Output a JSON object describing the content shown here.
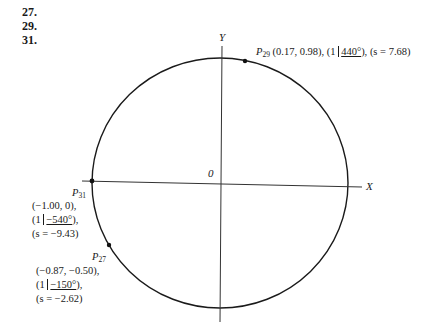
{
  "problem_numbers": [
    "27.",
    "29.",
    "31."
  ],
  "axes": {
    "x_label": "X",
    "y_label": "Y",
    "origin_label": "0"
  },
  "points": {
    "p29": {
      "name": "P",
      "sub": "29",
      "coords": "(0.17, 0.98),",
      "polar_prefix": "(1 ",
      "angle": "440°",
      "polar_suffix": "),",
      "arc": "(s = 7.68)"
    },
    "p31": {
      "name": "P",
      "sub": "31",
      "coords": "(−1.00, 0),",
      "polar_prefix": "(1 ",
      "angle": "−540°",
      "polar_suffix": "),",
      "arc": "(s = −9.43)"
    },
    "p27": {
      "name": "P",
      "sub": "27",
      "coords": "(−0.87, −0.50),",
      "polar_prefix": "(1 ",
      "angle": "−150°",
      "polar_suffix": "),",
      "arc": "(s = −2.62)"
    }
  }
}
